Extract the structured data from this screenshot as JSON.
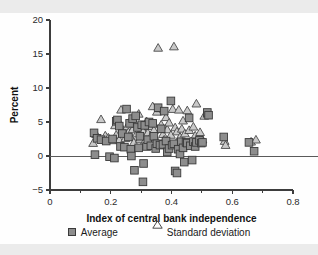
{
  "figure": {
    "name": "scatter-plot-central-bank-independence"
  },
  "chart_data": {
    "type": "scatter",
    "title": "",
    "xlabel": "Index of central bank independence",
    "ylabel": "Percent",
    "xlim": [
      0,
      0.8
    ],
    "ylim": [
      -5,
      20
    ],
    "xticks": [
      0,
      0.2,
      0.4,
      0.6,
      0.8
    ],
    "xtick_labels": [
      "0",
      "0.2",
      "0.4",
      "0.6",
      "0.8"
    ],
    "xminor_ticks": [
      0.1,
      0.3,
      0.5,
      0.7
    ],
    "yticks": [
      -5,
      0,
      5,
      10,
      15,
      20
    ],
    "ytick_labels": [
      "−5",
      "0",
      "5",
      "10",
      "15",
      "20"
    ],
    "grid": false,
    "zero_line": true,
    "legend_position": "below",
    "series": [
      {
        "name": "Average",
        "marker": "square",
        "color": "#8d8d8d",
        "edge_color": "#3a3a3a",
        "points": [
          [
            0.145,
            3.4
          ],
          [
            0.148,
            0.2
          ],
          [
            0.155,
            2.6
          ],
          [
            0.168,
            2.4
          ],
          [
            0.185,
            2.2
          ],
          [
            0.196,
            -0.1
          ],
          [
            0.206,
            2.5
          ],
          [
            0.212,
            -0.3
          ],
          [
            0.218,
            5.1
          ],
          [
            0.222,
            5.3
          ],
          [
            0.228,
            4.4
          ],
          [
            0.232,
            1.4
          ],
          [
            0.238,
            3.3
          ],
          [
            0.245,
            1.3
          ],
          [
            0.252,
            6.9
          ],
          [
            0.258,
            2.8
          ],
          [
            0.262,
            4.8
          ],
          [
            0.266,
            1.0
          ],
          [
            0.268,
            0.0
          ],
          [
            0.272,
            5.5
          ],
          [
            0.278,
            -2.1
          ],
          [
            0.282,
            5.9
          ],
          [
            0.288,
            4.2
          ],
          [
            0.292,
            1.2
          ],
          [
            0.296,
            2.9
          ],
          [
            0.302,
            4.6
          ],
          [
            0.306,
            -3.8
          ],
          [
            0.308,
            -1.1
          ],
          [
            0.312,
            4.5
          ],
          [
            0.318,
            1.4
          ],
          [
            0.322,
            2.4
          ],
          [
            0.326,
            5.0
          ],
          [
            0.332,
            1.5
          ],
          [
            0.338,
            4.8
          ],
          [
            0.342,
            2.9
          ],
          [
            0.348,
            1.1
          ],
          [
            0.352,
            1.8
          ],
          [
            0.356,
            7.1
          ],
          [
            0.362,
            1.6
          ],
          [
            0.366,
            4.0
          ],
          [
            0.372,
            1.7
          ],
          [
            0.376,
            6.6
          ],
          [
            0.382,
            2.2
          ],
          [
            0.386,
            0.6
          ],
          [
            0.392,
            1.1
          ],
          [
            0.398,
            8.1
          ],
          [
            0.402,
            1.6
          ],
          [
            0.408,
            1.8
          ],
          [
            0.412,
            -2.2
          ],
          [
            0.418,
            -2.5
          ],
          [
            0.422,
            1.0
          ],
          [
            0.428,
            0.3
          ],
          [
            0.432,
            2.1
          ],
          [
            0.438,
            1.2
          ],
          [
            0.442,
            -0.9
          ],
          [
            0.448,
            2.0
          ],
          [
            0.452,
            1.9
          ],
          [
            0.458,
            5.6
          ],
          [
            0.462,
            1.5
          ],
          [
            0.468,
            -0.6
          ],
          [
            0.472,
            2.1
          ],
          [
            0.478,
            1.4
          ],
          [
            0.482,
            2.0
          ],
          [
            0.492,
            2.3
          ],
          [
            0.498,
            1.9
          ],
          [
            0.502,
            2.0
          ],
          [
            0.518,
            6.4
          ],
          [
            0.522,
            6.0
          ],
          [
            0.572,
            2.8
          ],
          [
            0.655,
            2.0
          ],
          [
            0.672,
            0.7
          ]
        ]
      },
      {
        "name": "Standard deviation",
        "marker": "triangle",
        "color": "#c9c9c9",
        "edge_color": "#4a4a4a",
        "points": [
          [
            0.142,
            1.9
          ],
          [
            0.152,
            3.2
          ],
          [
            0.168,
            5.4
          ],
          [
            0.182,
            3.0
          ],
          [
            0.192,
            2.7
          ],
          [
            0.205,
            2.3
          ],
          [
            0.214,
            4.5
          ],
          [
            0.218,
            3.1
          ],
          [
            0.224,
            5.2
          ],
          [
            0.228,
            2.4
          ],
          [
            0.234,
            6.8
          ],
          [
            0.238,
            4.0
          ],
          [
            0.244,
            3.6
          ],
          [
            0.248,
            2.6
          ],
          [
            0.254,
            4.3
          ],
          [
            0.258,
            3.5
          ],
          [
            0.262,
            5.0
          ],
          [
            0.266,
            2.8
          ],
          [
            0.272,
            3.9
          ],
          [
            0.276,
            2.0
          ],
          [
            0.282,
            4.7
          ],
          [
            0.286,
            3.3
          ],
          [
            0.292,
            6.2
          ],
          [
            0.296,
            2.5
          ],
          [
            0.302,
            4.1
          ],
          [
            0.306,
            3.7
          ],
          [
            0.312,
            2.2
          ],
          [
            0.318,
            5.1
          ],
          [
            0.322,
            3.4
          ],
          [
            0.326,
            4.4
          ],
          [
            0.332,
            2.9
          ],
          [
            0.338,
            7.3
          ],
          [
            0.342,
            3.8
          ],
          [
            0.346,
            2.7
          ],
          [
            0.352,
            6.5
          ],
          [
            0.356,
            15.9
          ],
          [
            0.362,
            7.0
          ],
          [
            0.366,
            4.6
          ],
          [
            0.372,
            3.2
          ],
          [
            0.376,
            2.4
          ],
          [
            0.382,
            5.7
          ],
          [
            0.386,
            3.9
          ],
          [
            0.392,
            4.9
          ],
          [
            0.398,
            3.1
          ],
          [
            0.404,
            6.9
          ],
          [
            0.408,
            16.1
          ],
          [
            0.412,
            4.2
          ],
          [
            0.418,
            3.6
          ],
          [
            0.424,
            6.8
          ],
          [
            0.428,
            2.8
          ],
          [
            0.434,
            4.0
          ],
          [
            0.438,
            5.2
          ],
          [
            0.444,
            3.3
          ],
          [
            0.452,
            6.7
          ],
          [
            0.458,
            3.8
          ],
          [
            0.464,
            2.1
          ],
          [
            0.472,
            4.3
          ],
          [
            0.478,
            3.0
          ],
          [
            0.482,
            7.7
          ],
          [
            0.488,
            2.6
          ],
          [
            0.494,
            3.5
          ],
          [
            0.502,
            2.4
          ],
          [
            0.508,
            5.9
          ],
          [
            0.518,
            6.2
          ],
          [
            0.575,
            2.2
          ],
          [
            0.578,
            1.6
          ],
          [
            0.662,
            2.1
          ],
          [
            0.678,
            2.4
          ]
        ]
      }
    ]
  },
  "legend": {
    "items": [
      {
        "label": "Average",
        "marker": "square"
      },
      {
        "label": "Standard deviation",
        "marker": "triangle"
      }
    ]
  }
}
